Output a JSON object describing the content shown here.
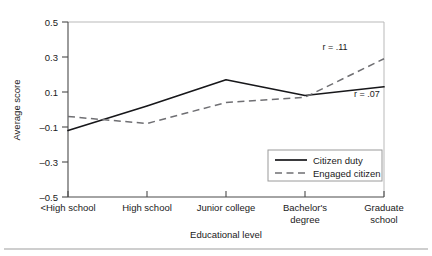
{
  "chart_data": {
    "type": "line",
    "title": "",
    "xlabel": "Educational level",
    "ylabel": "Average score",
    "categories": [
      "<High school",
      "High school",
      "Junior college",
      "Bachelor's degree",
      "Graduate school"
    ],
    "category_lines": [
      [
        "<High school"
      ],
      [
        "High school"
      ],
      [
        "Junior college"
      ],
      [
        "Bachelor's",
        "degree"
      ],
      [
        "Graduate",
        "school"
      ]
    ],
    "ylim": [
      -0.5,
      0.5
    ],
    "yticks": [
      0.5,
      0.3,
      0.1,
      -0.1,
      -0.3,
      -0.5
    ],
    "ytick_labels": [
      "0.5",
      "0.3",
      "0.1",
      "–0.1",
      "–0.3",
      "–0.5"
    ],
    "grid": false,
    "legend_position": "bottom-right",
    "series": [
      {
        "name": "Citizen duty",
        "style": "solid",
        "color": "#17171a",
        "values": [
          -0.12,
          0.02,
          0.17,
          0.08,
          0.13
        ],
        "annotation": "r = .07"
      },
      {
        "name": "Engaged citizen",
        "style": "dashed",
        "color": "#6f6f73",
        "values": [
          -0.04,
          -0.08,
          0.04,
          0.07,
          0.29
        ],
        "annotation": "r = .11"
      }
    ],
    "annotations": [
      {
        "text": "r = .11",
        "series": "Engaged citizen"
      },
      {
        "text": "r = .07",
        "series": "Citizen duty"
      }
    ]
  },
  "legend": {
    "items": [
      {
        "label": "Citizen duty",
        "style": "solid"
      },
      {
        "label": "Engaged citizen",
        "style": "dashed"
      }
    ]
  }
}
